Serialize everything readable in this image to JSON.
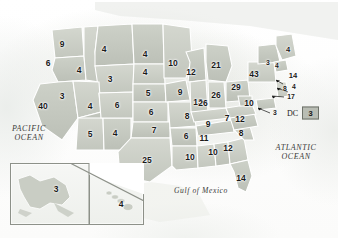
{
  "map": {
    "title": "United States electoral vote map",
    "colors": {
      "state_fill": "#c9cdc4",
      "state_fill_alt": "#d7dad2",
      "state_border": "#ffffff",
      "outline": "#8d9189",
      "label": "#1a1a1a",
      "legend_box": "#b9bdb4",
      "water_label": "#3a3a38"
    },
    "water_labels": [
      {
        "name": "pacific-ocean-label",
        "line1": "PACIFIC",
        "line2": "OCEAN",
        "x": 29,
        "y": 133
      },
      {
        "name": "atlantic-ocean-label",
        "line1": "ATLANTIC",
        "line2": "OCEAN",
        "x": 296,
        "y": 152
      },
      {
        "name": "gulf-of-mexico-label",
        "line1": "Gulf of Mexico",
        "line2": "",
        "x": 201,
        "y": 190
      }
    ],
    "legend": {
      "dc_label": "DC",
      "dc_value": "3"
    },
    "inset": {
      "alaska_value": "3",
      "hawaii_value": "4"
    },
    "state_values": [
      {
        "name": "washington",
        "value": "9",
        "x": 62,
        "y": 44,
        "size": "s11"
      },
      {
        "name": "oregon",
        "value": "6",
        "x": 48,
        "y": 63,
        "size": "s11"
      },
      {
        "name": "idaho",
        "value": "4",
        "x": 79,
        "y": 70,
        "size": "s11"
      },
      {
        "name": "montana",
        "value": "4",
        "x": 104,
        "y": 49,
        "size": "s11"
      },
      {
        "name": "wyoming",
        "value": "3",
        "x": 110,
        "y": 79,
        "size": "s11"
      },
      {
        "name": "north-dakota",
        "value": "4",
        "x": 145,
        "y": 54,
        "size": "s11"
      },
      {
        "name": "south-dakota",
        "value": "4",
        "x": 145,
        "y": 72,
        "size": "s11"
      },
      {
        "name": "nebraska",
        "value": "5",
        "x": 148,
        "y": 93,
        "size": "s11"
      },
      {
        "name": "kansas",
        "value": "6",
        "x": 151,
        "y": 112,
        "size": "s11"
      },
      {
        "name": "california",
        "value": "40",
        "x": 43,
        "y": 106,
        "size": "s11"
      },
      {
        "name": "nevada",
        "value": "3",
        "x": 62,
        "y": 96,
        "size": "s11"
      },
      {
        "name": "utah",
        "value": "4",
        "x": 90,
        "y": 106,
        "size": "s11"
      },
      {
        "name": "arizona",
        "value": "5",
        "x": 90,
        "y": 134,
        "size": "s11"
      },
      {
        "name": "new-mexico",
        "value": "4",
        "x": 115,
        "y": 133,
        "size": "s11"
      },
      {
        "name": "colorado",
        "value": "6",
        "x": 117,
        "y": 105,
        "size": "s11"
      },
      {
        "name": "oklahoma",
        "value": "7",
        "x": 154,
        "y": 130,
        "size": "s11"
      },
      {
        "name": "texas",
        "value": "25",
        "x": 147,
        "y": 160,
        "size": "s11"
      },
      {
        "name": "minnesota",
        "value": "10",
        "x": 173,
        "y": 63,
        "size": "s11"
      },
      {
        "name": "iowa",
        "value": "9",
        "x": 180,
        "y": 92,
        "size": "s11"
      },
      {
        "name": "missouri",
        "value": "8",
        "x": 187,
        "y": 116,
        "size": "s11"
      },
      {
        "name": "arkansas",
        "value": "6",
        "x": 186,
        "y": 136,
        "size": "s11"
      },
      {
        "name": "louisiana",
        "value": "10",
        "x": 190,
        "y": 157,
        "size": "s11"
      },
      {
        "name": "wisconsin",
        "value": "12",
        "x": 191,
        "y": 72,
        "size": "s11"
      },
      {
        "name": "illinois",
        "value": "13",
        "x": 198,
        "y": 102,
        "size": "s11"
      },
      {
        "name": "michigan",
        "value": "21",
        "x": 216,
        "y": 65,
        "size": "s11"
      },
      {
        "name": "indiana",
        "value": "26",
        "x": 216,
        "y": 95,
        "size": "s11"
      },
      {
        "name": "kentucky",
        "value": "26",
        "x": 203,
        "y": 103,
        "size": "s11"
      },
      {
        "name": "tennessee",
        "value": "9",
        "x": 208,
        "y": 124,
        "size": "s11"
      },
      {
        "name": "mississippi",
        "value": "11",
        "x": 204,
        "y": 138,
        "size": "s11"
      },
      {
        "name": "alabama",
        "value": "10",
        "x": 213,
        "y": 152,
        "size": "s11"
      },
      {
        "name": "georgia",
        "value": "12",
        "x": 228,
        "y": 148,
        "size": "s11"
      },
      {
        "name": "florida",
        "value": "14",
        "x": 241,
        "y": 178,
        "size": "s11"
      },
      {
        "name": "south-carolina",
        "value": "8",
        "x": 241,
        "y": 133,
        "size": "s11"
      },
      {
        "name": "north-carolina",
        "value": "12",
        "x": 240,
        "y": 119,
        "size": "s11"
      },
      {
        "name": "virginia",
        "value": "7",
        "x": 227,
        "y": 118,
        "size": "s11"
      },
      {
        "name": "ohio",
        "value": "29",
        "x": 236,
        "y": 87,
        "size": "s11"
      },
      {
        "name": "pennsylvania",
        "value": "43",
        "x": 254,
        "y": 74,
        "size": "s11"
      },
      {
        "name": "west-virginia",
        "value": "10",
        "x": 249,
        "y": 103,
        "size": "s11"
      },
      {
        "name": "maryland",
        "value": "3",
        "x": 275,
        "y": 113,
        "size": "s9"
      },
      {
        "name": "new-york",
        "value": "3",
        "x": 268,
        "y": 63,
        "size": "s9"
      },
      {
        "name": "vermont",
        "value": "4",
        "x": 277,
        "y": 66,
        "size": "s9"
      },
      {
        "name": "maine",
        "value": "4",
        "x": 288,
        "y": 50,
        "size": "s10"
      },
      {
        "name": "massachusetts",
        "value": "14",
        "x": 293,
        "y": 76,
        "size": "s10"
      },
      {
        "name": "connecticut",
        "value": "8",
        "x": 285,
        "y": 89,
        "size": "s9"
      },
      {
        "name": "rhode-island",
        "value": "4",
        "x": 294,
        "y": 87,
        "size": "s9"
      },
      {
        "name": "new-jersey",
        "value": "17",
        "x": 291,
        "y": 97,
        "size": "s9"
      }
    ]
  }
}
